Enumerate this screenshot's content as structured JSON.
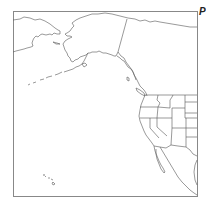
{
  "map": {
    "corner_label": "P",
    "line_color": "#555555",
    "frame_color": "#777777",
    "background": "#ffffff",
    "regions": [
      "Russian Far East",
      "Alaska",
      "Aleutian Islands",
      "Canada",
      "Western United States",
      "Mexico",
      "Baja California",
      "Hawaii"
    ]
  }
}
